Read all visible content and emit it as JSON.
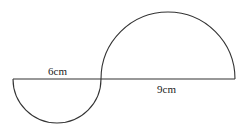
{
  "diagram": {
    "labels": {
      "small_diameter": "6cm",
      "large_diameter": "9cm"
    },
    "stroke_color": "#333333"
  }
}
